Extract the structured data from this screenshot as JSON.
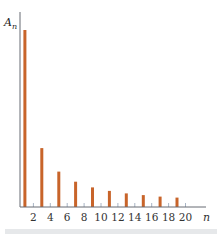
{
  "chart_data": {
    "type": "bar",
    "title": "",
    "xlabel": "n",
    "ylabel": "A_n",
    "x": [
      1,
      3,
      5,
      7,
      9,
      11,
      13,
      15,
      17,
      19
    ],
    "values": [
      1.0,
      0.333,
      0.2,
      0.143,
      0.111,
      0.091,
      0.077,
      0.067,
      0.059,
      0.053
    ],
    "xticks": [
      2,
      4,
      6,
      8,
      10,
      12,
      14,
      16,
      18,
      20
    ],
    "xlim": [
      0,
      21
    ],
    "ylim": [
      0,
      1.05
    ],
    "grid": false,
    "legend": null,
    "bar_color": "#c8642a",
    "axis_color": "#666b73",
    "tick_color": "#a8b4c4"
  },
  "labels": {
    "y_main": "A",
    "y_sub": "n",
    "x": "n"
  }
}
